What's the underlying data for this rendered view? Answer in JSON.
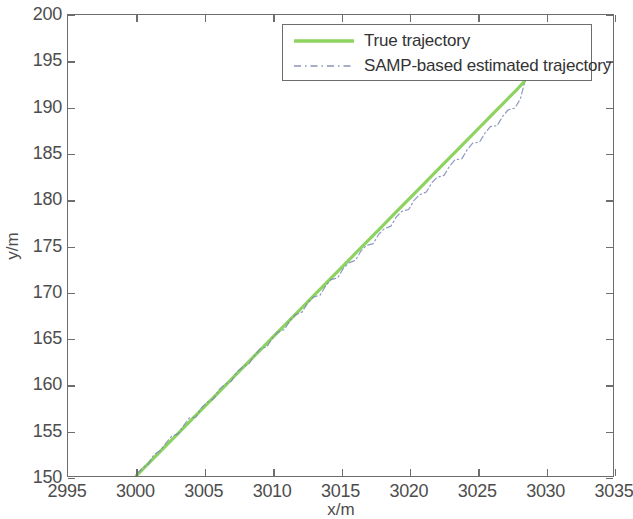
{
  "chart_data": {
    "type": "line",
    "title": "",
    "xlabel": "x/m",
    "ylabel": "y/m",
    "xlim": [
      2995,
      3035
    ],
    "ylim": [
      150,
      200
    ],
    "xticks": [
      2995,
      3000,
      3005,
      3010,
      3015,
      3020,
      3025,
      3030,
      3035
    ],
    "yticks": [
      150,
      155,
      160,
      165,
      170,
      175,
      180,
      185,
      190,
      195,
      200
    ],
    "grid": false,
    "legend_position": "top-center-right",
    "series": [
      {
        "name": "True trajectory",
        "style": "solid",
        "color": "#8dd35f",
        "width": 3.2,
        "x": [
          3000.0,
          3001.0,
          3002.0,
          3003.0,
          3004.0,
          3005.0,
          3006.0,
          3007.0,
          3008.0,
          3009.0,
          3010.0,
          3011.0,
          3012.0,
          3013.0,
          3014.0,
          3015.0,
          3016.0,
          3017.0,
          3018.0,
          3019.0,
          3020.0,
          3021.0,
          3022.0,
          3023.0,
          3024.0,
          3025.0,
          3026.0,
          3027.0,
          3028.0,
          3028.5
        ],
        "y": [
          150.0,
          151.5,
          153.0,
          154.5,
          156.0,
          157.5,
          159.0,
          160.5,
          162.0,
          163.5,
          165.0,
          166.5,
          168.0,
          169.5,
          171.0,
          172.5,
          174.0,
          175.5,
          177.0,
          178.5,
          180.0,
          181.5,
          183.0,
          184.5,
          186.0,
          187.5,
          189.0,
          190.5,
          192.0,
          192.8
        ]
      },
      {
        "name": "SAMP-based estimated trajectory",
        "style": "dash-dot",
        "color": "#7a86b8",
        "width": 1.2,
        "x": [
          3000.1,
          3000.5,
          3000.9,
          3001.3,
          3001.8,
          3002.2,
          3002.6,
          3003.1,
          3003.5,
          3003.9,
          3004.4,
          3004.8,
          3005.2,
          3005.7,
          3006.1,
          3006.5,
          3007.0,
          3007.4,
          3007.8,
          3008.3,
          3008.7,
          3009.1,
          3009.6,
          3010.0,
          3010.4,
          3010.9,
          3011.3,
          3011.7,
          3012.2,
          3012.6,
          3013.0,
          3013.5,
          3013.9,
          3014.3,
          3014.8,
          3015.2,
          3015.6,
          3016.1,
          3016.5,
          3016.9,
          3017.4,
          3017.8,
          3018.2,
          3018.7,
          3019.1,
          3019.5,
          3020.0,
          3020.4,
          3020.8,
          3021.3,
          3021.7,
          3022.1,
          3022.6,
          3023.0,
          3023.4,
          3023.9,
          3024.3,
          3024.7,
          3025.2,
          3025.6,
          3026.0,
          3026.5,
          3026.9,
          3027.3,
          3027.8,
          3028.2,
          3028.5
        ],
        "y": [
          150.3,
          150.9,
          151.3,
          152.3,
          152.8,
          153.6,
          154.3,
          154.6,
          155.5,
          156.3,
          156.4,
          157.4,
          158.0,
          158.4,
          159.4,
          159.9,
          160.3,
          161.3,
          161.8,
          162.2,
          163.1,
          163.8,
          164.0,
          165.0,
          165.6,
          165.9,
          166.9,
          167.5,
          167.8,
          168.8,
          169.4,
          169.6,
          170.6,
          171.3,
          171.5,
          172.5,
          173.1,
          173.4,
          174.4,
          175.0,
          175.2,
          176.2,
          176.8,
          177.1,
          178.1,
          178.7,
          178.9,
          179.9,
          180.5,
          180.8,
          181.8,
          182.4,
          182.6,
          183.6,
          184.3,
          184.4,
          185.4,
          186.1,
          186.2,
          187.2,
          187.9,
          188.0,
          189.0,
          189.7,
          189.9,
          190.9,
          192.6
        ]
      }
    ]
  },
  "legend": {
    "items": [
      {
        "label": "True trajectory"
      },
      {
        "label": "SAMP-based estimated trajectory"
      }
    ]
  },
  "axes": {
    "x_title": "x/m",
    "y_title": "y/m",
    "x_tick_labels": [
      "2995",
      "3000",
      "3005",
      "3010",
      "3015",
      "3020",
      "3025",
      "3030",
      "3035"
    ],
    "y_tick_labels": [
      "150",
      "155",
      "160",
      "165",
      "170",
      "175",
      "180",
      "185",
      "190",
      "195",
      "200"
    ]
  },
  "colors": {
    "true_trajectory": "#8dd35f",
    "estimated_trajectory": "#7a86b8",
    "axis": "#6d6d6d",
    "text": "#4d4d4d",
    "background": "#ffffff"
  }
}
